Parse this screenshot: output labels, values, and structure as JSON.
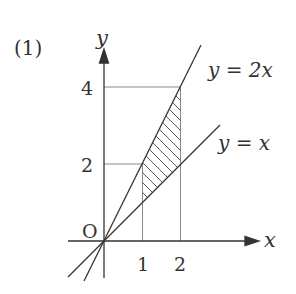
{
  "problem_label": "(1)",
  "axes": {
    "x_label": "x",
    "y_label": "y",
    "origin_label": "O"
  },
  "ticks": {
    "x": [
      "1",
      "2"
    ],
    "y": [
      "2",
      "4"
    ]
  },
  "lines": [
    {
      "name": "y=2x",
      "label": "y = 2x"
    },
    {
      "name": "y=x",
      "label": "y = x"
    }
  ],
  "shaded_region": "Region between y=2x and y=x for 1 ≤ x ≤ 2",
  "colors": {
    "ink": "#333333",
    "guide": "#777777",
    "background": "#ffffff"
  }
}
